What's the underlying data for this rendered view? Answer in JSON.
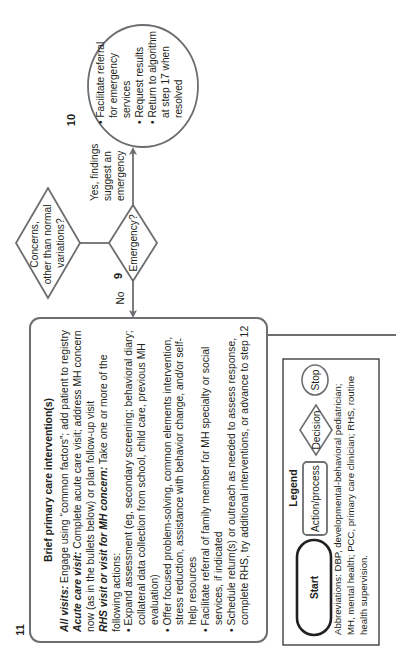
{
  "colors": {
    "stroke": "#6d6e71",
    "text": "#231f20",
    "background": "#ffffff",
    "legend_border": "#231f20"
  },
  "step9": {
    "number": "9",
    "concerns_diamond": {
      "lines": [
        "Concerns,",
        "other than normal",
        "variations?"
      ]
    },
    "emergency_diamond": {
      "label": "Emergency?"
    },
    "yes_label": [
      "Yes, findings",
      "suggest an",
      "emergency"
    ],
    "no_label": "No"
  },
  "step10": {
    "number": "10",
    "lines": [
      "• Facilitate referral",
      "for emergency",
      "services",
      "• Request results",
      "• Return to algorithm",
      "at step 17 when",
      "resolved"
    ]
  },
  "step11": {
    "number": "11",
    "title": "Brief primary care intervention(s)",
    "all_visits": {
      "label": "All visits:",
      "text": " Engage using “common factors”; add patient to registry"
    },
    "acute_care": {
      "label": "Acute care visit:",
      "text": " Complete acute care visit; address MH concern",
      "text2": "now (as in the bullets below) or plan follow-up visit"
    },
    "rhs_visit": {
      "label": "RHS visit or visit for MH concern:",
      "text": " Take one or more of the",
      "text2": "following actions:"
    },
    "bullets": [
      {
        "lines": [
          "• Expand assessment (eg, secondary screening; behavioral diary;",
          "collateral data collection from school, child care, previous MH",
          "evaluation)"
        ]
      },
      {
        "lines": [
          "• Offer focused problem-solving, common elements intervention,",
          "stress reduction, assistance with behavior change, and/or self-",
          "help resources"
        ]
      },
      {
        "lines": [
          "• Facilitate referral of family member for MH specialty or social",
          "services, if indicated"
        ]
      },
      {
        "lines": [
          "• Schedule return(s) or outreach as needed to assess response,",
          "complete RHS, try additional interventions, or advance to step 12"
        ]
      }
    ]
  },
  "legend": {
    "title": "Legend",
    "start": "Start",
    "action": "Action/process",
    "decision": "Decision",
    "stop": "Stop",
    "abbreviations": [
      "Abbreviations: DBP, developmental-behavioral pediatrician;",
      "MH, mental health; PCC, primary care clinician; RHS, routine",
      "health supervision."
    ]
  }
}
